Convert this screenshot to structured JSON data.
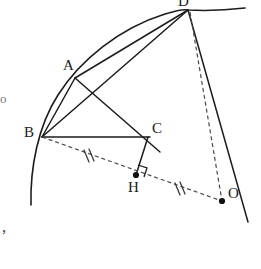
{
  "figure": {
    "kind": "geometry-diagram",
    "width": 261,
    "height": 269,
    "background_color": "#ffffff",
    "ink_color": "#1c1c1c",
    "dash_color": "#4a4a4a"
  },
  "points": [
    {
      "id": "A",
      "label": "A",
      "x": 75,
      "y": 78,
      "label_x": 63,
      "label_y": 60,
      "marker": "none"
    },
    {
      "id": "B",
      "label": "B",
      "x": 42,
      "y": 137,
      "label_x": 25,
      "label_y": 125,
      "marker": "none"
    },
    {
      "id": "C",
      "label": "C",
      "x": 148,
      "y": 137,
      "label_x": 152,
      "label_y": 122,
      "marker": "none"
    },
    {
      "id": "D",
      "label": "D",
      "x": 188,
      "y": 10,
      "label_x": 178,
      "label_y": -5,
      "marker": "none"
    },
    {
      "id": "H",
      "label": "H",
      "x": 136,
      "y": 175,
      "label_x": 127,
      "label_y": 180,
      "marker": "dot"
    },
    {
      "id": "O",
      "label": "O",
      "x": 222,
      "y": 201,
      "label_x": 228,
      "label_y": 186,
      "marker": "dot"
    }
  ],
  "arcs": [
    {
      "id": "main-arc",
      "name": "circle-arc-through-B-A-D",
      "path": "M 31 205 C 30 168 38 126 58 95 C 80 60 120 28 165 14 C 178 10 184 9 188 10 C 205 11 228 10 245 8",
      "style": "solid"
    }
  ],
  "segments": [
    {
      "id": "BA",
      "name": "chord-B-A",
      "from": "B",
      "to": "A",
      "style": "solid"
    },
    {
      "id": "BD",
      "name": "chord-B-D",
      "from": "B",
      "to": "D",
      "style": "solid"
    },
    {
      "id": "AD",
      "name": "chord-A-D",
      "from": "A",
      "to": "D",
      "style": "solid"
    },
    {
      "id": "AC",
      "name": "segment-A-C",
      "from": "A",
      "to": "C",
      "style": "solid"
    },
    {
      "id": "BC",
      "name": "segment-B-C",
      "from": "B",
      "to": "C",
      "style": "solid"
    },
    {
      "id": "DO",
      "name": "line-D-through-C-to-O-extended",
      "from": "D",
      "to": "O",
      "style": "solid",
      "extend_to": {
        "x": 248,
        "y": 222
      }
    },
    {
      "id": "CH",
      "name": "segment-C-H-perpendicular",
      "from": "C",
      "to": "H",
      "style": "solid"
    }
  ],
  "dashed_segments": [
    {
      "id": "BO",
      "name": "dashed-segment-B-H-O",
      "from": "B",
      "to": "O",
      "style": "dashed"
    },
    {
      "id": "DOdash",
      "name": "dashed-segment-D-O",
      "from": "D",
      "to": "O",
      "style": "dashed"
    }
  ],
  "tick_marks": [
    {
      "id": "tick-BH",
      "name": "equal-length-tick-B-H",
      "x": 88,
      "y": 158,
      "count": 2,
      "on_segment": "BO"
    },
    {
      "id": "tick-HO",
      "name": "equal-length-tick-H-O",
      "x": 179,
      "y": 190,
      "count": 2,
      "on_segment": "BO"
    }
  ],
  "right_angle": {
    "id": "right-angle-H",
    "name": "right-angle-marker-at-H",
    "at": "H",
    "x": 136,
    "y": 175,
    "size": 9,
    "note": "CH perpendicular to BO"
  },
  "margin_marks": [
    {
      "id": "left-fragment",
      "name": "margin-text-fragment-left",
      "text": "o",
      "x": 1,
      "y": 93
    },
    {
      "id": "bottom-comma",
      "name": "margin-comma-bottom-left",
      "text": ",",
      "x": 3,
      "y": 222
    }
  ]
}
